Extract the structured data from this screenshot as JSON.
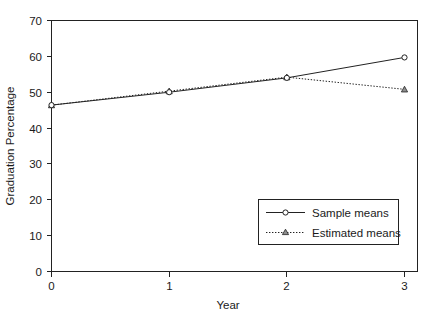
{
  "chart_data": {
    "type": "line",
    "title": "",
    "xlabel": "Year",
    "ylabel": "Graduation Percentage",
    "x": [
      0,
      1,
      2,
      3
    ],
    "xtick_labels": [
      "0",
      "1",
      "2",
      "3"
    ],
    "ytick_labels": [
      "0",
      "10",
      "20",
      "30",
      "40",
      "50",
      "60",
      "70"
    ],
    "yticks": [
      0,
      10,
      20,
      30,
      40,
      50,
      60,
      70
    ],
    "xlim": [
      -0.13,
      3.13
    ],
    "ylim": [
      0,
      70
    ],
    "grid": false,
    "legend_position": "lower right",
    "series": [
      {
        "name": "Sample means",
        "values": [
          46.4,
          50.0,
          54.0,
          59.7
        ],
        "line_style": "solid",
        "marker": "open-circle",
        "color": "#222222"
      },
      {
        "name": "Estimated means",
        "values": [
          46.4,
          50.3,
          54.2,
          50.8
        ],
        "line_style": "dotted",
        "marker": "triangle",
        "color": "#222222"
      }
    ]
  },
  "legend": {
    "entries": [
      {
        "label": "Sample means"
      },
      {
        "label": "Estimated means"
      }
    ]
  },
  "axes": {
    "x_title": "Year",
    "y_title": "Graduation Percentage"
  },
  "colors": {
    "background": "#ffffff",
    "ink": "#222222",
    "marker_fill": "#8f8f8f"
  }
}
